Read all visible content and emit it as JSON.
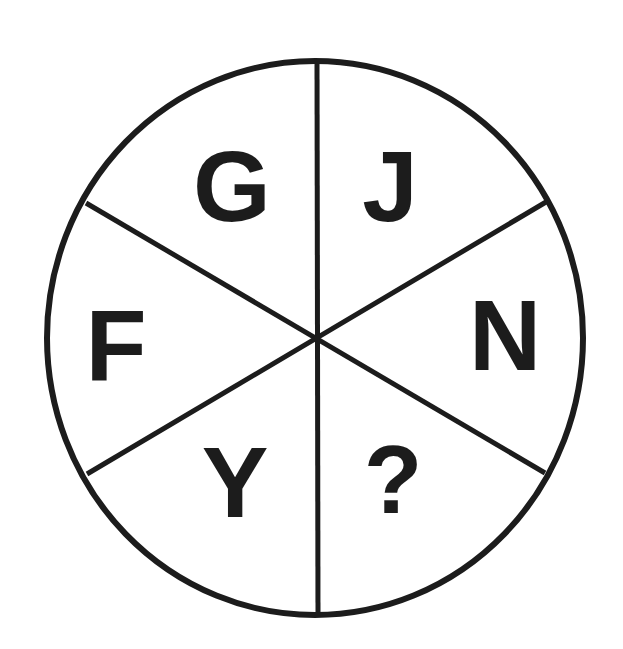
{
  "puzzle": {
    "type": "letter-wheel",
    "segments": [
      {
        "position": "top-left",
        "letter": "G"
      },
      {
        "position": "top-right",
        "letter": "J"
      },
      {
        "position": "right",
        "letter": "N"
      },
      {
        "position": "bottom-right",
        "letter": "?"
      },
      {
        "position": "bottom-left",
        "letter": "Y"
      },
      {
        "position": "left",
        "letter": "F"
      }
    ]
  },
  "colors": {
    "line": "#1c1c1c",
    "background": "#ffffff",
    "text": "#1c1c1c"
  }
}
